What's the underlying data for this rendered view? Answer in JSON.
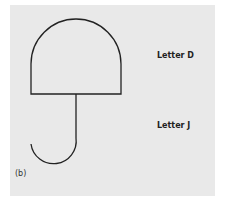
{
  "figure": {
    "caption": "(b)",
    "labels": {
      "letter_d": "Letter D",
      "letter_j": "Letter J"
    },
    "colors": {
      "background": "#e9e9e9",
      "stroke": "#222222"
    }
  }
}
